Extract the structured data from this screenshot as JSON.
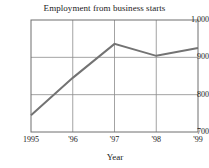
{
  "chart_data": {
    "type": "line",
    "title": "Employment from business starts",
    "xlabel": "Year",
    "ylabel": "",
    "categories": [
      "1995",
      "'96",
      "'97",
      "'98",
      "'99"
    ],
    "x": [
      1995,
      1996,
      1997,
      1998,
      1999
    ],
    "values": [
      745,
      845,
      936,
      904,
      925
    ],
    "series": [
      {
        "name": "Employment from business starts",
        "values": [
          745,
          845,
          936,
          904,
          925
        ]
      }
    ],
    "ylim": [
      700,
      1000
    ],
    "yticks": [
      700,
      800,
      900,
      1000
    ],
    "ytick_labels": [
      "700",
      "800",
      "900",
      "1,000"
    ],
    "xtick_labels": [
      "1995",
      "'96",
      "'97",
      "'98",
      "'99"
    ],
    "grid": true,
    "grid_axis": "both",
    "legend": "none",
    "line_color": "#737373",
    "grid_color": "#8c8c8c",
    "frame_color": "#6e6e6e",
    "background": "#ffffff"
  },
  "axes": {
    "y_tick_labels": [
      "1,000",
      "900",
      "800",
      "700"
    ],
    "x_tick_labels": [
      "1995",
      "'96",
      "'97",
      "'98",
      "'99"
    ],
    "x_axis_title": "Year"
  }
}
